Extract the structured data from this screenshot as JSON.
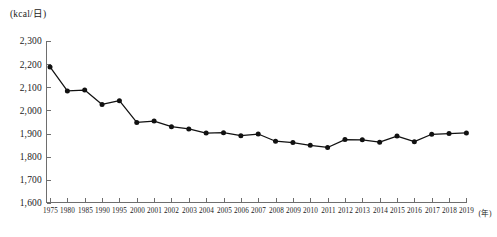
{
  "chart_data": {
    "type": "line",
    "title": "",
    "subtitle": "",
    "xlabel": "(年)",
    "ylabel": "(kcal/日)",
    "unit_label": "(kcal/日)",
    "grid": false,
    "legend": null,
    "ylim": [
      1600,
      2300
    ],
    "yticks": [
      1600,
      1700,
      1800,
      1900,
      2000,
      2100,
      2200,
      2300
    ],
    "ytick_labels": [
      "1,600",
      "1,700",
      "1,800",
      "1,900",
      "2,000",
      "2,100",
      "2,200",
      "2,300"
    ],
    "categories": [
      "1975",
      "1980",
      "1985",
      "1990",
      "1995",
      "2000",
      "2001",
      "2002",
      "2003",
      "2004",
      "2005",
      "2006",
      "2007",
      "2008",
      "2009",
      "2010",
      "2011",
      "2012",
      "2013",
      "2014",
      "2015",
      "2016",
      "2017",
      "2018",
      "2019"
    ],
    "values": [
      2188,
      2084,
      2088,
      2026,
      2042,
      1948,
      1954,
      1930,
      1920,
      1902,
      1904,
      1891,
      1898,
      1867,
      1861,
      1849,
      1840,
      1874,
      1873,
      1863,
      1889,
      1865,
      1897,
      1900,
      1903
    ],
    "series": [
      {
        "name": "1人1日当たり供給熱量",
        "values": [
          2188,
          2084,
          2088,
          2026,
          2042,
          1948,
          1954,
          1930,
          1920,
          1902,
          1904,
          1891,
          1898,
          1867,
          1861,
          1849,
          1840,
          1874,
          1873,
          1863,
          1889,
          1865,
          1897,
          1900,
          1903
        ]
      }
    ],
    "marker": "circle",
    "marker_color": "#111111",
    "line_color": "#111111"
  },
  "axes": {
    "x_unit_suffix": "(年)",
    "y_unit_header": "(kcal/日)"
  }
}
